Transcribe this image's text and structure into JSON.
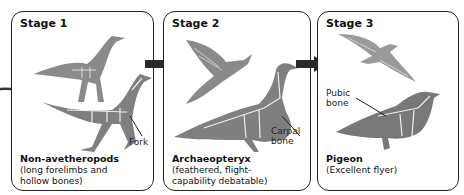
{
  "diagram": {
    "stages": [
      {
        "title": "Stage 1",
        "name": "Non-avetheropods",
        "description_line1": "(long forelimbs and",
        "description_line2": "hollow bones)",
        "labels": [
          "Fork"
        ]
      },
      {
        "title": "Stage 2",
        "name": "Archaeopteryx",
        "description_line1": "(feathered, flight-",
        "description_line2": "capability debatable)",
        "labels": [
          "Carpal",
          "bone"
        ]
      },
      {
        "title": "Stage 3",
        "name": "Pigeon",
        "description_line1": "(Excellent flyer)",
        "description_line2": "",
        "labels": [
          "Pubic",
          "bone"
        ]
      }
    ],
    "arrows": [
      "stage1-to-stage2",
      "stage2-to-stage3"
    ],
    "colors": {
      "border": "#222222",
      "arrow": "#2a2a2a",
      "illustration": "#7a7a7a",
      "skeleton": "#f0f0f0"
    }
  }
}
